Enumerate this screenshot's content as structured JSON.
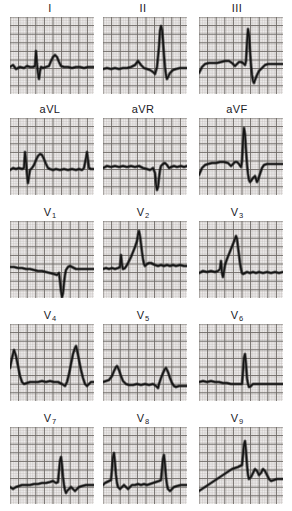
{
  "figure": {
    "kind": "electrocardiogram-tracing-sheet",
    "background_color": "#ffffff",
    "grid_fine_color": "#b9b3b1",
    "grid_bold_color": "#6e6966",
    "trace_color": "#141414",
    "label_color": "#20201f",
    "rows": 5,
    "columns": 3,
    "total_leads": 15
  },
  "rows": [
    {
      "row_index": 0,
      "leads": [
        {
          "label": "I",
          "base": "I",
          "sub": "",
          "name": "lead-i",
          "baseline": 50,
          "morphology": "low-amplitude baseline with small sharp r spike, rounded T wave, thick noisy isoelectric line",
          "points": "0,50 3,48 6,52 10,50 14,51 17,49 20,50 23,50 25,49 26,34 27,47 28,56 29,62 30,54 31,50 33,51 36,50 39,49 41,44 43,40 45,38 47,40 49,45 51,49 54,50 58,50 62,51 66,50 70,50 74,51 78,50 82,50 84,50"
        },
        {
          "label": "II",
          "base": "II",
          "sub": "",
          "name": "lead-ii",
          "baseline": 50,
          "morphology": "flat baseline, small P bump, very tall narrow R wave near right edge followed by S and recovery",
          "points": "0,52 4,51 8,52 12,51 16,52 20,51 24,51 28,50 32,48 35,44 38,48 41,51 44,52 47,53 50,55 52,57 54,50 56,30 57,14 58,9 59,13 60,24 61,38 62,50 63,58 64,62 65,60 67,56 70,53 73,52 77,51 81,51 84,51"
        },
        {
          "label": "III",
          "base": "III",
          "sub": "",
          "name": "lead-iii",
          "baseline": 47,
          "morphology": "elevated thick baseline, small notch, then sharp tall R spike and deep S wave trough before recovery",
          "points": "0,56 3,50 6,47 10,46 14,46 18,46 22,45 26,44 30,44 33,46 36,49 38,47 40,45 42,45 44,46 46,48 47,44 48,26 49,12 50,18 51,34 52,48 53,58 54,64 55,66 56,63 58,58 60,54 62,52 64,50 66,48 69,47 73,47 77,47 81,47 84,47"
        }
      ]
    },
    {
      "row_index": 1,
      "leads": [
        {
          "label": "aVL",
          "base": "aVL",
          "sub": "",
          "name": "lead-avl",
          "baseline": 50,
          "morphology": "thick baseline with narrow upright spike, broad rounded R/T complex, second spike at right margin",
          "points": "0,52 3,50 6,51 9,50 12,51 14,50 15,34 16,44 17,56 18,65 19,58 20,52 22,50 24,47 26,42 28,38 30,36 32,37 34,41 36,46 38,50 40,51 43,52 46,51 50,52 54,51 58,52 62,51 66,52 69,51 72,52 74,50 76,40 77,34 78,42 79,50 81,51 84,51"
        },
        {
          "label": "aVR",
          "base": "aVR",
          "sub": "",
          "name": "lead-avr",
          "baseline": 48,
          "morphology": "flat thick baseline with deep narrow QS downstroke right of centre, small recovery hump",
          "points": "0,50 4,48 8,49 12,48 16,49 20,48 24,49 28,48 32,49 36,48 40,50 44,51 47,52 50,50 52,55 53,66 54,72 55,69 56,60 57,52 58,48 60,46 62,45 64,47 66,50 68,49 71,48 74,49 78,48 81,49 84,48"
        },
        {
          "label": "aVF",
          "base": "aVF",
          "sub": "",
          "name": "lead-avf",
          "baseline": 46,
          "morphology": "raised baseline, small notch, tall narrow R spike then deep wide S trough and partial recovery",
          "points": "0,57 3,50 6,47 9,46 13,45 17,45 21,44 25,44 29,45 32,48 34,46 36,44 38,44 40,46 42,49 43,43 44,24 45,10 46,16 47,32 48,46 49,56 50,62 51,64 52,63 54,60 56,58 57,61 58,64 59,62 61,56 63,50 65,47 68,46 72,46 76,46 80,46 84,46"
        }
      ]
    },
    {
      "row_index": 2,
      "leads": [
        {
          "label": "V1",
          "base": "V",
          "sub": "1",
          "name": "lead-v1",
          "baseline": 48,
          "morphology": "thick nearly flat baseline sloping slightly down, then a very deep narrow QS deflection, small recovery",
          "points": "0,46 4,46 8,47 12,47 16,48 20,48 24,49 28,50 32,50 36,51 40,52 44,53 47,54 49,52 50,60 51,70 52,76 53,72 54,62 55,54 56,49 58,46 60,45 62,46 64,47 66,48 69,48 72,48 76,48 80,48 84,48"
        },
        {
          "label": "V2",
          "base": "V",
          "sub": "2",
          "name": "lead-v2",
          "baseline": 48,
          "morphology": "thick baseline, narrow pre-spike, then a tall peaked R wave with broad ST shoulder and noisy return",
          "points": "0,48 3,47 6,48 9,47 12,48 15,47 17,46 18,34 19,44 20,48 22,47 24,44 26,40 28,36 30,31 32,26 34,20 35,14 36,10 37,15 38,23 39,31 40,38 41,43 42,45 44,43 46,42 48,42 50,43 52,44 55,45 58,44 61,45 64,44 67,45 70,44 73,45 77,44 81,45 84,45"
        },
        {
          "label": "V3",
          "base": "V",
          "sub": "3",
          "name": "lead-v3",
          "baseline": 50,
          "morphology": "thick flat baseline then sharp tall peaked R wave with rapid return and slightly depressed ST segment",
          "points": "0,52 4,50 8,51 12,50 16,51 19,50 21,48 22,40 23,52 24,56 25,50 26,44 28,38 30,33 32,28 34,23 36,18 37,15 38,18 39,26 40,34 41,42 42,48 43,52 44,53 46,52 48,51 51,52 54,51 57,52 60,51 64,52 68,51 72,52 76,51 80,52 84,51"
        }
      ]
    },
    {
      "row_index": 3,
      "leads": [
        {
          "label": "V4",
          "base": "V",
          "sub": "4",
          "name": "lead-v4",
          "baseline": 56,
          "morphology": "two tall pointed R waves, one at left edge and one at right, separated by a thick flat depressed ST baseline",
          "points": "0,44 2,34 4,26 6,32 8,42 10,52 12,58 14,60 17,59 20,58 24,58 28,58 32,57 36,58 40,57 44,58 48,58 52,60 55,62 57,58 59,50 61,40 63,30 65,24 66,22 67,26 69,36 71,46 73,54 75,60 77,62 79,60 81,58 84,58"
        },
        {
          "label": "V5",
          "base": "V",
          "sub": "5",
          "name": "lead-v5",
          "baseline": 58,
          "morphology": "lower amplitude version of V4, two modest R peaks at the edges with a long thick flat baseline between",
          "points": "0,58 3,57 6,56 9,52 11,47 13,43 14,42 16,46 18,52 20,57 23,60 26,61 30,61 34,60 38,61 42,60 46,61 50,60 53,62 55,64 56,60 58,54 60,49 62,45 63,44 65,48 67,54 69,59 71,62 73,63 76,62 80,62 84,62"
        },
        {
          "label": "V6",
          "base": "V",
          "sub": "6",
          "name": "lead-v6",
          "baseline": 58,
          "morphology": "thick heavy flat baseline with a single very narrow upright spike right of centre",
          "points": "0,58 4,57 8,58 12,57 16,58 20,58 24,59 28,59 32,60 36,60 40,60 43,60 44,48 45,34 46,30 47,40 48,54 49,60 50,63 52,62 54,60 57,60 60,60 64,60 68,60 72,60 76,60 80,60 84,60"
        }
      ]
    },
    {
      "row_index": 4,
      "leads": [
        {
          "label": "V7",
          "base": "V",
          "sub": "7",
          "name": "lead-v7",
          "baseline": 58,
          "morphology": "thick flat baseline with a small hump then a narrow tall spike and a shallow negative wave after it",
          "points": "0,60 3,62 6,60 9,59 12,58 16,58 20,58 24,57 28,57 32,56 36,56 40,55 43,54 46,56 48,55 49,44 50,34 51,30 52,38 53,50 54,58 55,63 56,66 57,64 59,62 61,60 63,62 65,64 67,62 69,60 72,59 76,58 80,58 84,58"
        },
        {
          "label": "V8",
          "base": "V",
          "sub": "8",
          "name": "lead-v8",
          "baseline": 58,
          "morphology": "two narrow tall spikes with wandering thick baseline and small undulations between them",
          "points": "0,58 2,56 4,55 6,54 8,53 9,42 10,30 11,26 12,36 13,48 14,56 15,60 17,62 19,60 21,58 23,60 25,62 27,60 29,58 32,58 35,57 38,58 41,57 44,58 47,57 50,56 53,55 56,54 58,53 59,42 60,32 61,28 62,38 63,50 64,58 65,62 67,64 69,62 71,60 74,59 78,58 81,58 84,58"
        },
        {
          "label": "V9",
          "base": "V",
          "sub": "9",
          "name": "lead-v9",
          "baseline": 50,
          "morphology": "upsloping thick baseline rising to a plateau, interrupted by a narrow tall spike, then notched descending wave",
          "points": "0,64 3,62 6,60 9,58 12,56 15,54 18,52 21,50 24,48 27,46 30,44 33,42 36,41 39,40 41,39 43,38 44,28 45,18 46,14 47,24 48,38 49,48 50,52 52,50 54,46 56,42 58,44 60,48 62,46 64,42 66,44 68,48 70,52 72,54 75,53 78,52 81,52 84,52"
        }
      ]
    }
  ]
}
